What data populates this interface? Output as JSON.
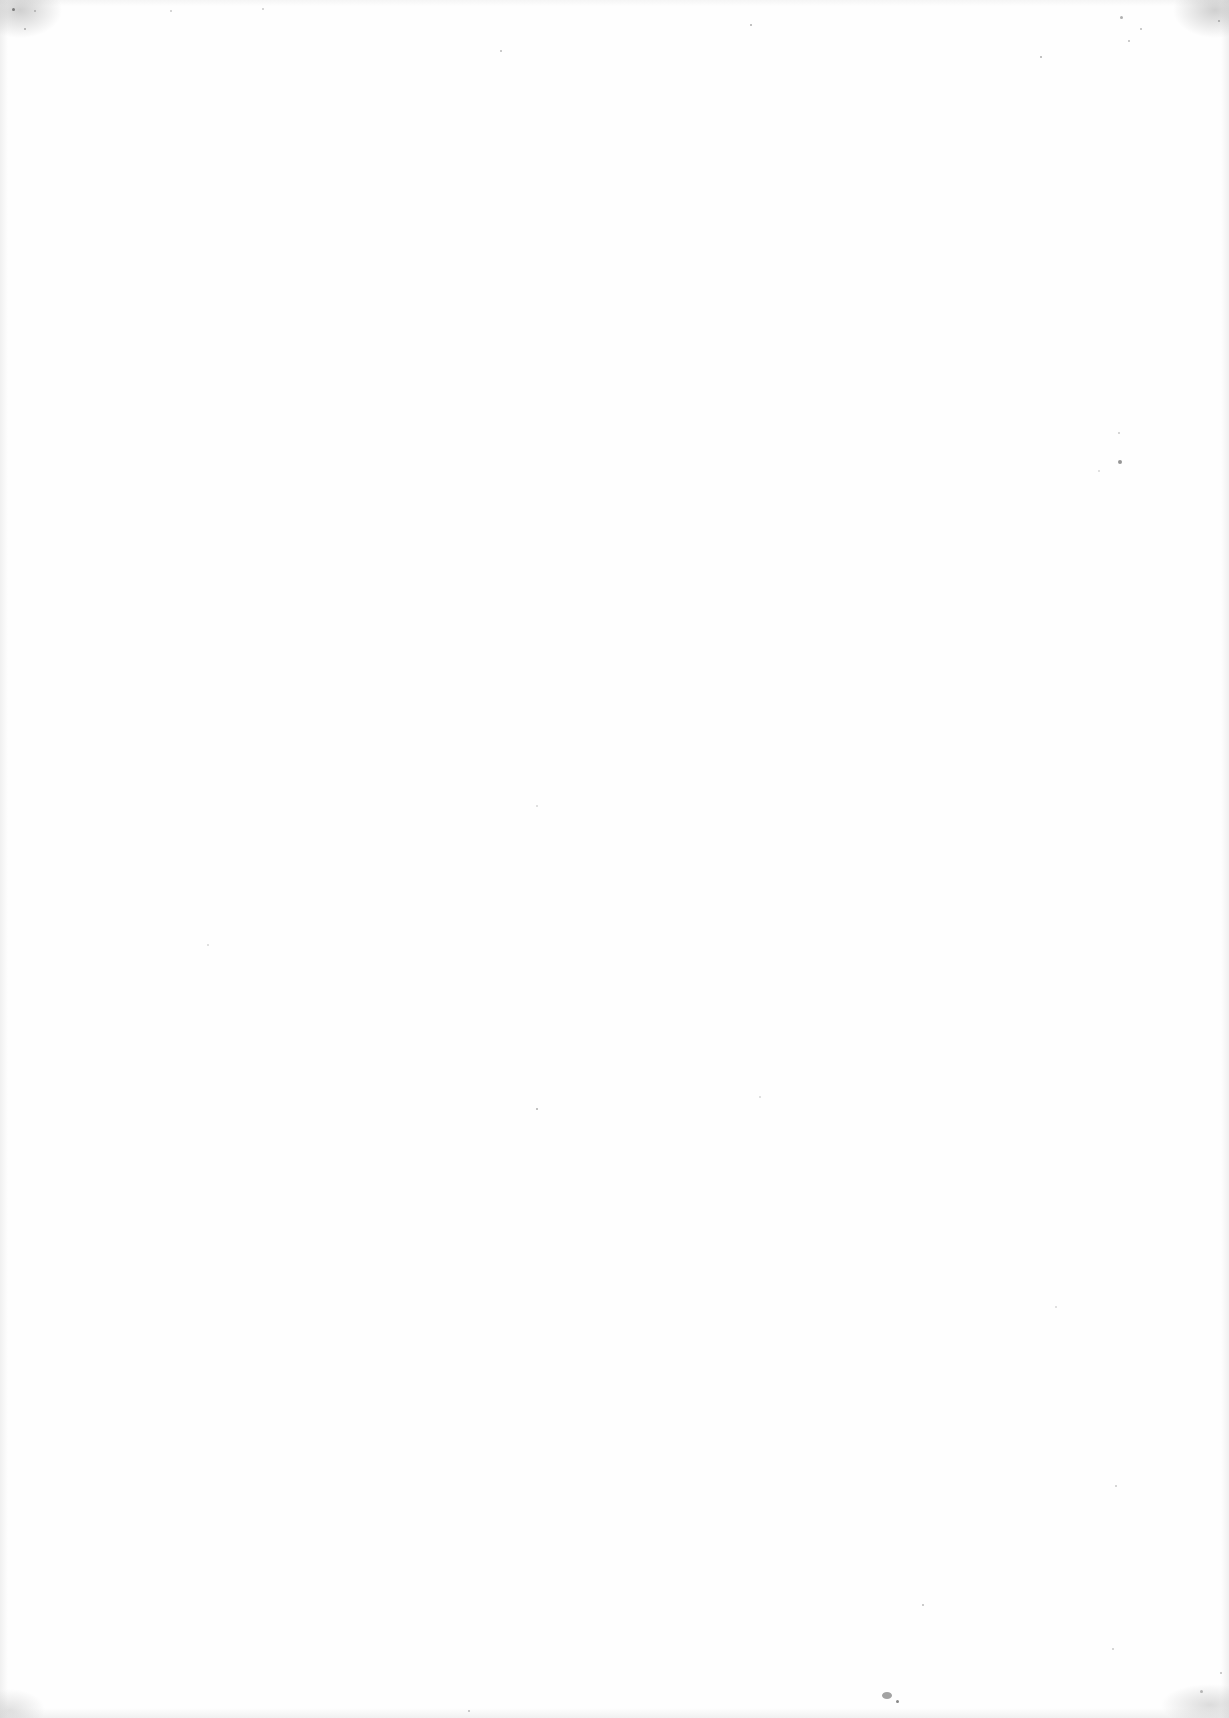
{
  "page": {
    "type": "blank-scanned-page",
    "background_color": "#fefefe",
    "noise_color": "#7a7a7a",
    "text_content": ""
  }
}
